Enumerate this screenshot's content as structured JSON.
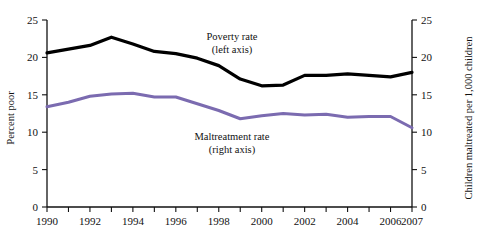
{
  "chart_data": {
    "type": "line",
    "title": "",
    "xlabel": "",
    "ylabel": "Percent poor",
    "y2label": "Children maltreated per 1,000 children",
    "grid": false,
    "legend_position": "inline-annotation",
    "x": [
      1990,
      1991,
      1992,
      1993,
      1994,
      1995,
      1996,
      1997,
      1998,
      1999,
      2000,
      2001,
      2002,
      2003,
      2004,
      2005,
      2006,
      2007
    ],
    "xlim": [
      1990,
      2007
    ],
    "xticks": [
      1990,
      1991,
      1992,
      1993,
      1994,
      1995,
      1996,
      1997,
      1998,
      1999,
      2000,
      2001,
      2002,
      2003,
      2004,
      2005,
      2006,
      2007
    ],
    "xtick_labels": [
      "1990",
      "",
      "1992",
      "",
      "1994",
      "",
      "1996",
      "",
      "1998",
      "",
      "2000",
      "",
      "2002",
      "",
      "2004",
      "",
      "2006",
      "2007"
    ],
    "ylim": [
      0,
      25
    ],
    "yticks": [
      0,
      5,
      10,
      15,
      20,
      25
    ],
    "ytick_labels": [
      "0",
      "5",
      "10",
      "15",
      "20",
      "25"
    ],
    "y2lim": [
      0,
      25
    ],
    "y2ticks": [
      0,
      5,
      10,
      15,
      20,
      25
    ],
    "y2tick_labels": [
      "0",
      "5",
      "10",
      "15",
      "20",
      "25"
    ],
    "series": [
      {
        "name": "Poverty rate",
        "axis": "left",
        "color": "#000000",
        "annotation": "Poverty rate",
        "annotation_sub": "(left axis)",
        "values": [
          20.6,
          21.1,
          21.6,
          22.7,
          21.8,
          20.8,
          20.5,
          19.9,
          18.9,
          17.1,
          16.2,
          16.3,
          17.6,
          17.6,
          17.8,
          17.6,
          17.4,
          18.0
        ]
      },
      {
        "name": "Maltreatment rate",
        "axis": "right",
        "color": "#7b6bb0",
        "annotation": "Maltreatment rate",
        "annotation_sub": "(right axis)",
        "values": [
          13.4,
          14.0,
          14.8,
          15.1,
          15.2,
          14.7,
          14.7,
          13.8,
          12.9,
          11.8,
          12.2,
          12.5,
          12.3,
          12.4,
          12.0,
          12.1,
          12.1,
          10.6
        ]
      }
    ]
  },
  "axes": {
    "left_title": "Percent poor",
    "right_title": "Children maltreated per 1,000 children"
  },
  "annotations": {
    "poverty": {
      "line1": "Poverty rate",
      "line2": "(left axis)"
    },
    "maltreatment": {
      "line1": "Maltreatment rate",
      "line2": "(right axis)"
    }
  },
  "colors": {
    "poverty": "#000000",
    "maltreatment": "#7b6bb0",
    "axis": "#111111",
    "background": "#ffffff"
  }
}
